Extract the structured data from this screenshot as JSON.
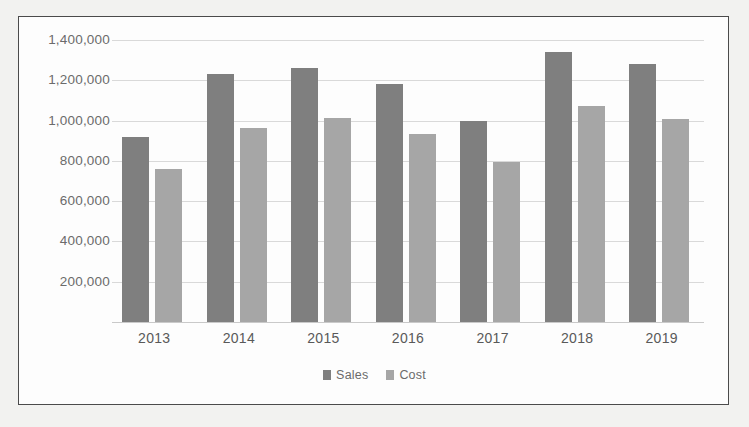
{
  "chart_data": {
    "type": "bar",
    "title": "",
    "subtitle": "",
    "xlabel": "",
    "ylabel": "",
    "categories": [
      "2013",
      "2014",
      "2015",
      "2016",
      "2017",
      "2018",
      "2019"
    ],
    "series": [
      {
        "name": "Sales",
        "color": "#7f7f7f",
        "values": [
          920000,
          1230000,
          1260000,
          1180000,
          1000000,
          1340000,
          1280000
        ]
      },
      {
        "name": "Cost",
        "color": "#a6a6a6",
        "values": [
          760000,
          965000,
          1015000,
          935000,
          795000,
          1075000,
          1010000
        ]
      }
    ],
    "ylim": [
      0,
      1450000
    ],
    "yticks": [
      200000,
      400000,
      600000,
      800000,
      1000000,
      1200000,
      1400000
    ],
    "ytick_labels": [
      "200,000",
      "400,000",
      "600,000",
      "800,000",
      "1,000,000",
      "1,200,000",
      "1,400,000"
    ],
    "grid": true,
    "legend_position": "bottom"
  },
  "legend": {
    "items": [
      {
        "label": "Sales",
        "color": "#7f7f7f",
        "swatch_name": "legend-swatch-sales"
      },
      {
        "label": "Cost",
        "color": "#a6a6a6",
        "swatch_name": "legend-swatch-cost"
      }
    ]
  },
  "colors": {
    "sales": "#7f7f7f",
    "cost": "#a6a6a6",
    "gridline": "#d9d9d9",
    "axis_text": "#6b6b6b",
    "border": "#4b4b4b",
    "plot_background": "#fdfdfd",
    "page_background": "#f2f2f0"
  }
}
